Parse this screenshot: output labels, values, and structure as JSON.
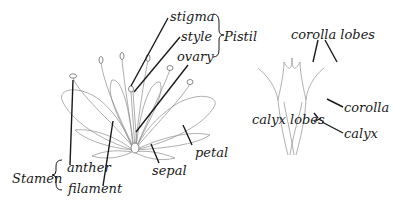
{
  "diagram": {
    "left_figure": {
      "name": "open flower",
      "labels": {
        "stigma": "stigma",
        "style": "style",
        "ovary": "ovary",
        "pistil": "Pistil",
        "anther": "anther",
        "filament": "filament",
        "stamen": "Stamen",
        "sepal": "sepal",
        "petal": "petal"
      }
    },
    "right_figure": {
      "name": "flower tube",
      "labels": {
        "corolla_lobes": "corolla lobes",
        "corolla": "corolla",
        "calyx_lobes": "calyx lobes",
        "calyx": "calyx"
      }
    },
    "colors": {
      "ink": "#1a1a1a",
      "sketch": "#8a8a8a",
      "background": "#ffffff"
    }
  }
}
